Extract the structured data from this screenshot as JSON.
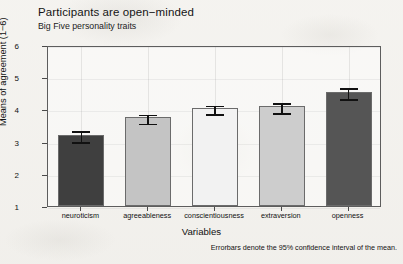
{
  "figure": {
    "title": "Participants are open−minded",
    "subtitle": "Big Five personality traits",
    "caption": "Errorbars denote the 95% confidence interval of the mean."
  },
  "chart_data": {
    "type": "bar",
    "title": "Participants are open−minded",
    "subtitle": "Big Five personality traits",
    "xlabel": "Variables",
    "ylabel": "Means of agreement (1−6)",
    "categories": [
      "neuroticism",
      "agreeableness",
      "conscientiousness",
      "extraversion",
      "openness"
    ],
    "values": [
      3.2,
      3.75,
      4.05,
      4.1,
      4.55
    ],
    "error_low": [
      3.05,
      3.62,
      3.92,
      3.95,
      4.38
    ],
    "error_high": [
      3.38,
      3.9,
      4.18,
      4.25,
      4.72
    ],
    "error_type": "95% confidence interval of the mean",
    "bar_colors": [
      "#3f3f3f",
      "#c4c4c4",
      "#f2f2f2",
      "#cdcdcd",
      "#555555"
    ],
    "ylim": [
      1,
      6
    ],
    "yticks": [
      1,
      2,
      3,
      4,
      5,
      6
    ],
    "ytick_labels": [
      "1",
      "2",
      "3",
      "4",
      "5",
      "6"
    ],
    "grid": true,
    "legend": "none",
    "annotation": "Errorbars denote the 95% confidence interval of the mean."
  }
}
